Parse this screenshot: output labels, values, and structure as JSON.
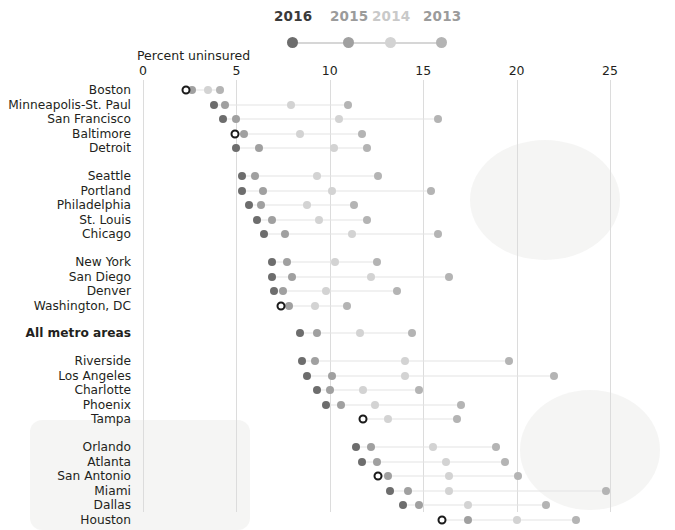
{
  "chart_data": {
    "type": "scatter",
    "subtype": "dot-plot-connected",
    "title": "",
    "xlabel": "Percent uninsured",
    "ylabel": "",
    "xlim": [
      0,
      25
    ],
    "xticks": [
      0,
      5,
      10,
      15,
      20,
      25
    ],
    "xtick_labels": [
      "0",
      "5",
      "10",
      "15",
      "20",
      "25"
    ],
    "grid": "vertical",
    "legend_position": "top-center",
    "legend": [
      {
        "name": "2016",
        "color": "#6d6d6d"
      },
      {
        "name": "2015",
        "color": "#a0a0a0"
      },
      {
        "name": "2014",
        "color": "#d3d3d3"
      },
      {
        "name": "2013",
        "color": "#b4b4b4"
      }
    ],
    "series": [
      "2016",
      "2015",
      "2014",
      "2013"
    ],
    "categories": [
      "Boston",
      "Minneapolis-St. Paul",
      "San Francisco",
      "Baltimore",
      "Detroit",
      "Seattle",
      "Portland",
      "Philadelphia",
      "St. Louis",
      "Chicago",
      "New York",
      "San Diego",
      "Denver",
      "Washington, DC",
      "All metro areas",
      "Riverside",
      "Los Angeles",
      "Charlotte",
      "Phoenix",
      "Tampa",
      "Orlando",
      "Atlanta",
      "San Antonio",
      "Miami",
      "Dallas",
      "Houston"
    ],
    "rows": [
      {
        "label": "Boston",
        "group": 0,
        "bold": false,
        "highlight2016": true,
        "values": {
          "2016": 2.3,
          "2015": 2.6,
          "2014": 3.5,
          "2013": 4.1
        }
      },
      {
        "label": "Minneapolis-St. Paul",
        "group": 0,
        "bold": false,
        "highlight2016": false,
        "values": {
          "2016": 3.8,
          "2015": 4.4,
          "2014": 7.9,
          "2013": 11.0
        }
      },
      {
        "label": "San Francisco",
        "group": 0,
        "bold": false,
        "highlight2016": false,
        "values": {
          "2016": 4.3,
          "2015": 5.0,
          "2014": 10.5,
          "2013": 15.8
        }
      },
      {
        "label": "Baltimore",
        "group": 0,
        "bold": false,
        "highlight2016": true,
        "values": {
          "2016": 4.9,
          "2015": 5.4,
          "2014": 8.4,
          "2013": 11.7
        }
      },
      {
        "label": "Detroit",
        "group": 0,
        "bold": false,
        "highlight2016": false,
        "values": {
          "2016": 5.0,
          "2015": 6.2,
          "2014": 10.2,
          "2013": 12.0
        }
      },
      {
        "label": "Seattle",
        "group": 1,
        "bold": false,
        "highlight2016": false,
        "values": {
          "2016": 5.3,
          "2015": 6.0,
          "2014": 9.3,
          "2013": 12.6
        }
      },
      {
        "label": "Portland",
        "group": 1,
        "bold": false,
        "highlight2016": false,
        "values": {
          "2016": 5.3,
          "2015": 6.4,
          "2014": 10.1,
          "2013": 15.4
        }
      },
      {
        "label": "Philadelphia",
        "group": 1,
        "bold": false,
        "highlight2016": false,
        "values": {
          "2016": 5.7,
          "2015": 6.3,
          "2014": 8.8,
          "2013": 11.3
        }
      },
      {
        "label": "St. Louis",
        "group": 1,
        "bold": false,
        "highlight2016": false,
        "values": {
          "2016": 6.1,
          "2015": 6.9,
          "2014": 9.4,
          "2013": 12.0
        }
      },
      {
        "label": "Chicago",
        "group": 1,
        "bold": false,
        "highlight2016": false,
        "values": {
          "2016": 6.5,
          "2015": 7.6,
          "2014": 11.2,
          "2013": 15.8
        }
      },
      {
        "label": "New York",
        "group": 2,
        "bold": false,
        "highlight2016": false,
        "values": {
          "2016": 6.9,
          "2015": 7.7,
          "2014": 10.3,
          "2013": 12.5
        }
      },
      {
        "label": "San Diego",
        "group": 2,
        "bold": false,
        "highlight2016": false,
        "values": {
          "2016": 6.9,
          "2015": 8.0,
          "2014": 12.2,
          "2013": 16.4
        }
      },
      {
        "label": "Denver",
        "group": 2,
        "bold": false,
        "highlight2016": false,
        "values": {
          "2016": 7.0,
          "2015": 7.5,
          "2014": 9.8,
          "2013": 13.6
        }
      },
      {
        "label": "Washington, DC",
        "group": 2,
        "bold": true,
        "highlight2016": true,
        "values": {
          "2016": 7.4,
          "2015": 7.8,
          "2014": 9.2,
          "2013": 10.9
        }
      },
      {
        "label": "All metro areas",
        "group": 3,
        "bold": true,
        "highlight2016": false,
        "values": {
          "2016": 8.4,
          "2015": 9.3,
          "2014": 11.6,
          "2013": 14.4
        }
      },
      {
        "label": "Riverside",
        "group": 4,
        "bold": false,
        "highlight2016": false,
        "values": {
          "2016": 8.5,
          "2015": 9.2,
          "2014": 14.0,
          "2013": 19.6
        }
      },
      {
        "label": "Los Angeles",
        "group": 4,
        "bold": false,
        "highlight2016": false,
        "values": {
          "2016": 8.8,
          "2015": 10.1,
          "2014": 14.0,
          "2013": 22.0
        }
      },
      {
        "label": "Charlotte",
        "group": 4,
        "bold": false,
        "highlight2016": false,
        "values": {
          "2016": 9.3,
          "2015": 10.0,
          "2014": 11.8,
          "2013": 14.8
        }
      },
      {
        "label": "Phoenix",
        "group": 4,
        "bold": false,
        "highlight2016": false,
        "values": {
          "2016": 9.8,
          "2015": 10.6,
          "2014": 12.4,
          "2013": 17.0
        }
      },
      {
        "label": "Tampa",
        "group": 4,
        "bold": false,
        "highlight2016": true,
        "values": {
          "2016": 11.8,
          "2015": 11.8,
          "2014": 13.1,
          "2013": 16.8
        }
      },
      {
        "label": "Orlando",
        "group": 5,
        "bold": false,
        "highlight2016": false,
        "values": {
          "2016": 11.4,
          "2015": 12.2,
          "2014": 15.5,
          "2013": 18.9
        }
      },
      {
        "label": "Atlanta",
        "group": 5,
        "bold": false,
        "highlight2016": false,
        "values": {
          "2016": 11.7,
          "2015": 12.5,
          "2014": 16.2,
          "2013": 19.4
        }
      },
      {
        "label": "San Antonio",
        "group": 5,
        "bold": true,
        "highlight2016": true,
        "values": {
          "2016": 12.6,
          "2015": 13.1,
          "2014": 16.4,
          "2013": 20.1
        }
      },
      {
        "label": "Miami",
        "group": 5,
        "bold": false,
        "highlight2016": false,
        "values": {
          "2016": 13.2,
          "2015": 14.2,
          "2014": 16.4,
          "2013": 24.8
        }
      },
      {
        "label": "Dallas",
        "group": 5,
        "bold": false,
        "highlight2016": false,
        "values": {
          "2016": 13.9,
          "2015": 14.8,
          "2014": 17.4,
          "2013": 21.6
        }
      },
      {
        "label": "Houston",
        "group": 5,
        "bold": true,
        "highlight2016": true,
        "values": {
          "2016": 16.0,
          "2015": 17.4,
          "2014": 20.0,
          "2013": 23.2
        }
      }
    ]
  },
  "colors": {
    "year_2016": "#6d6d6d",
    "year_2015": "#a0a0a0",
    "year_2014": "#d3d3d3",
    "year_2013": "#b4b4b4",
    "gridline": "#dcdcdc",
    "connector": "#e4e4e4",
    "text": "#231f20",
    "background": "#ffffff"
  },
  "axis": {
    "title": "Percent uninsured",
    "ticks": [
      "0",
      "5",
      "10",
      "15",
      "20",
      "25"
    ]
  }
}
